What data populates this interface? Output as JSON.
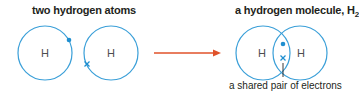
{
  "left_panel": {
    "title": "two hydrogen atoms",
    "atoms": [
      {
        "symbol": "H",
        "electron": "dot"
      },
      {
        "symbol": "H",
        "electron": "cross"
      }
    ]
  },
  "right_panel": {
    "title": "a hydrogen molecule, H",
    "title_subscript": "2",
    "atoms": [
      {
        "symbol": "H"
      },
      {
        "symbol": "H"
      }
    ],
    "shared_electrons": [
      "dot",
      "cross"
    ],
    "caption": "a shared pair of electrons"
  },
  "colors": {
    "circle": "#3a9fd8",
    "electron": "#1f8fd0",
    "arrow": "#e0522a",
    "text": "#231f20"
  }
}
